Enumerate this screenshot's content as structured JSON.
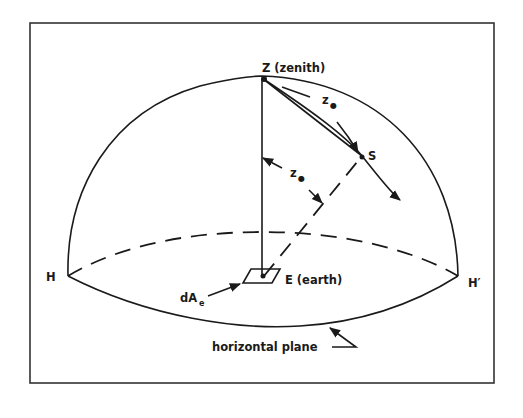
{
  "figure": {
    "frame_color": "#333333",
    "ink_color": "#1a1a1a",
    "labels": {
      "zenith": "Z (zenith)",
      "sun": "S",
      "earth": "E (earth)",
      "horizon_left": "H",
      "horizon_right": "H′",
      "area_main": "dA",
      "area_sub": "e",
      "angle_main": "z",
      "angle_sub": "●",
      "plane": "horizontal plane"
    }
  }
}
